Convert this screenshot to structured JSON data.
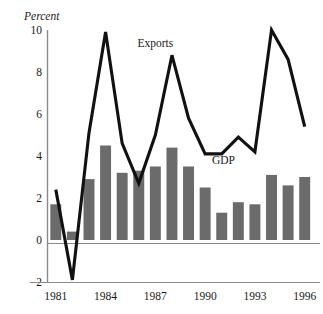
{
  "chart_data": {
    "type": "bar",
    "title": "",
    "subtitle": "",
    "unit_label": "Percent",
    "xlabel": "",
    "ylabel": "",
    "ylim": [
      -2,
      10
    ],
    "yticks": [
      -2,
      0,
      2,
      4,
      6,
      8,
      10
    ],
    "ytick_labels": [
      "−2",
      "0",
      "2",
      "4",
      "6",
      "8",
      "10"
    ],
    "grid": false,
    "legend_position": "inline-annotation",
    "x": [
      1981,
      1982,
      1983,
      1984,
      1985,
      1986,
      1987,
      1988,
      1989,
      1990,
      1991,
      1992,
      1993,
      1994,
      1995,
      1996
    ],
    "xticks": [
      1981,
      1984,
      1987,
      1990,
      1993,
      1996
    ],
    "xtick_labels": [
      "1981",
      "1984",
      "1987",
      "1990",
      "1993",
      "1996"
    ],
    "series": [
      {
        "name": "GDP",
        "kind": "bar",
        "color": "#6b6b6b",
        "label_text": "GDP",
        "values": [
          1.7,
          0.4,
          2.9,
          4.5,
          3.2,
          3.3,
          3.5,
          4.4,
          3.5,
          2.5,
          1.3,
          1.8,
          1.7,
          3.1,
          2.6,
          3.0
        ]
      },
      {
        "name": "Exports",
        "kind": "line",
        "color": "#111111",
        "label_text": "Exports",
        "values": [
          2.4,
          -1.9,
          5.1,
          9.9,
          4.6,
          2.7,
          5.0,
          8.8,
          5.8,
          4.1,
          4.1,
          4.9,
          4.2,
          10.0,
          8.6,
          5.4
        ]
      }
    ],
    "annotations": [
      {
        "text": "Exports",
        "x_value": 1987,
        "y_value": 9.2
      },
      {
        "text": "GDP",
        "x_value": 1991.1,
        "y_value": 3.6
      }
    ],
    "colors": {
      "bar_fill": "#6b6b6b",
      "line_stroke": "#111111",
      "axis": "#8a8a8a",
      "text": "#1a1a1a",
      "background": "#ffffff"
    }
  }
}
